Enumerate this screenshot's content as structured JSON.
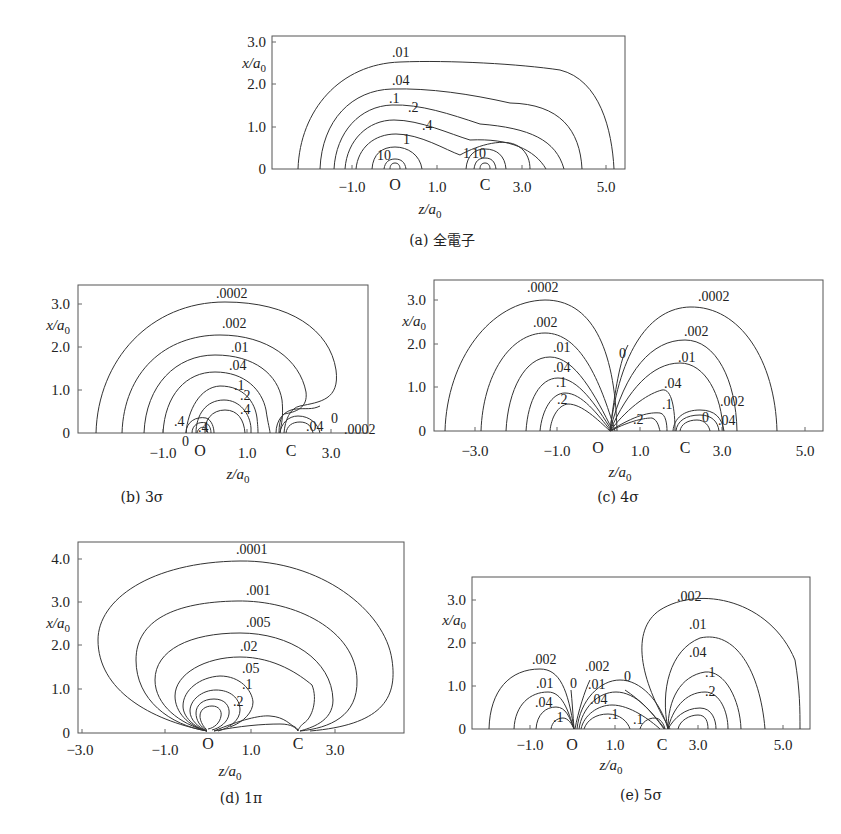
{
  "chart_data": [
    {
      "id": "a",
      "type": "contour",
      "caption": "(a) 全電子",
      "title": "全電子",
      "xlabel": "z/a0",
      "ylabel": "x/a0",
      "xticks": [
        "-1.0",
        "1.0",
        "3.0",
        "5.0"
      ],
      "xtick_values": [
        -1.0,
        1.0,
        3.0,
        5.0
      ],
      "yticks": [
        "0",
        "1.0",
        "2.0",
        "3.0"
      ],
      "ytick_values": [
        0,
        1.0,
        2.0,
        3.0
      ],
      "xlim": [
        -2.9,
        5.5
      ],
      "ylim": [
        0,
        3.1
      ],
      "atoms": [
        {
          "label": "O",
          "z": 0.0
        },
        {
          "label": "C",
          "z": 2.13
        }
      ],
      "contour_levels": [
        "10",
        "1",
        ".4",
        ".2",
        ".1",
        ".04",
        ".01",
        "10",
        "1"
      ],
      "contour_labels": [
        {
          "text": ".01",
          "z": 0.2,
          "x": 2.55
        },
        {
          "text": ".04",
          "z": 0.2,
          "x": 1.95
        },
        {
          "text": ".1",
          "z": 0.1,
          "x": 1.55
        },
        {
          "text": ".2",
          "z": 0.5,
          "x": 1.3
        },
        {
          "text": ".4",
          "z": 0.9,
          "x": 0.95
        },
        {
          "text": "1",
          "z": 0.35,
          "x": 0.62
        },
        {
          "text": "10",
          "z": -0.1,
          "x": 0.28
        },
        {
          "text": "1",
          "z": 1.8,
          "x": 0.3
        },
        {
          "text": "10",
          "z": 2.05,
          "x": 0.3
        }
      ]
    },
    {
      "id": "b",
      "type": "contour",
      "caption": "(b) 3σ",
      "title": "3σ",
      "xlabel": "z/a0",
      "ylabel": "x/a0",
      "xticks": [
        "-1.0",
        "1.0",
        "3.0"
      ],
      "xtick_values": [
        -1.0,
        1.0,
        3.0
      ],
      "yticks": [
        "0",
        "1.0",
        "2.0",
        "3.0"
      ],
      "ytick_values": [
        0,
        1.0,
        2.0,
        3.0
      ],
      "xlim": [
        -2.8,
        3.9
      ],
      "ylim": [
        0,
        3.5
      ],
      "atoms": [
        {
          "label": "O",
          "z": 0.0
        },
        {
          "label": "C",
          "z": 2.13
        }
      ],
      "contour_levels": [
        ".0002",
        ".002",
        ".01",
        ".04",
        ".1",
        ".2",
        ".4",
        ".4",
        ".4",
        "0",
        ".04",
        "0",
        ".0002"
      ],
      "contour_labels": [
        {
          "text": ".0002",
          "z": 1.0,
          "x": 3.25
        },
        {
          "text": ".002",
          "z": 1.0,
          "x": 2.55
        },
        {
          "text": ".01",
          "z": 1.0,
          "x": 1.95
        },
        {
          "text": ".04",
          "z": 0.9,
          "x": 1.55
        },
        {
          "text": ".1",
          "z": 0.9,
          "x": 1.05
        },
        {
          "text": ".2",
          "z": 1.0,
          "x": 0.85
        },
        {
          "text": ".4",
          "z": 1.0,
          "x": 0.55
        },
        {
          "text": ".4",
          "z": -0.35,
          "x": 0.25
        },
        {
          "text": ".4",
          "z": 0.1,
          "x": 0.12
        },
        {
          "text": "0",
          "z": -0.3,
          "x": -0.05
        },
        {
          "text": ".04",
          "z": 2.75,
          "x": 0.2
        },
        {
          "text": "0",
          "z": 3.15,
          "x": 0.4
        },
        {
          "text": ".0002",
          "z": 3.6,
          "x": 0.15
        }
      ]
    },
    {
      "id": "c",
      "type": "contour",
      "caption": "(c) 4σ",
      "title": "4σ",
      "xlabel": "z/a0",
      "ylabel": "x/a0",
      "xticks": [
        "-3.0",
        "-1.0",
        "1.0",
        "3.0",
        "5.0"
      ],
      "xtick_values": [
        -3.0,
        -1.0,
        1.0,
        3.0,
        5.0
      ],
      "yticks": [
        "0",
        "1.0",
        "2.0",
        "3.0"
      ],
      "ytick_values": [
        0,
        1.0,
        2.0,
        3.0
      ],
      "xlim": [
        -4.0,
        5.6
      ],
      "ylim": [
        0,
        3.5
      ],
      "atoms": [
        {
          "label": "O",
          "z": 0.0
        },
        {
          "label": "C",
          "z": 2.13
        }
      ],
      "contour_levels": [
        ".0002",
        ".002",
        ".01",
        ".04",
        ".1",
        ".2",
        "0",
        ".0002",
        ".002",
        ".01",
        ".04",
        ".1",
        ".2",
        ".002",
        "0",
        ".04"
      ],
      "contour_labels": [
        {
          "text": ".0002",
          "z": -1.5,
          "x": 3.35
        },
        {
          "text": ".002",
          "z": -1.1,
          "x": 2.5
        },
        {
          "text": ".01",
          "z": -0.9,
          "x": 1.85
        },
        {
          "text": ".04",
          "z": -0.85,
          "x": 1.4
        },
        {
          "text": ".1",
          "z": -0.85,
          "x": 1.05
        },
        {
          "text": ".2",
          "z": -0.85,
          "x": 0.7
        },
        {
          "text": "0",
          "z": 0.45,
          "x": 1.85
        },
        {
          "text": ".0002",
          "z": 3.2,
          "x": 3.1
        },
        {
          "text": ".002",
          "z": 2.7,
          "x": 2.35
        },
        {
          "text": ".01",
          "z": 2.55,
          "x": 1.7
        },
        {
          "text": ".04",
          "z": 1.9,
          "x": 1.05
        },
        {
          "text": ".1",
          "z": 1.7,
          "x": 0.6
        },
        {
          "text": ".2",
          "z": 1.15,
          "x": 0.3
        },
        {
          "text": ".002",
          "z": 3.2,
          "x": 0.7
        },
        {
          "text": "0",
          "z": 2.55,
          "x": 0.28
        },
        {
          "text": ".04",
          "z": 3.2,
          "x": 0.2
        }
      ]
    },
    {
      "id": "d",
      "type": "contour",
      "caption": "(d) 1π",
      "title": "1π",
      "xlabel": "z/a0",
      "ylabel": "x/a0",
      "xticks": [
        "-3.0",
        "-1.0",
        "1.0",
        "3.0"
      ],
      "xtick_values": [
        -3.0,
        -1.0,
        1.0,
        3.0
      ],
      "yticks": [
        "0",
        "1.0",
        "2.0",
        "3.0",
        "4.0"
      ],
      "ytick_values": [
        0,
        1.0,
        2.0,
        3.0,
        4.0
      ],
      "xlim": [
        -3.1,
        4.5
      ],
      "ylim": [
        0,
        4.3
      ],
      "atoms": [
        {
          "label": "O",
          "z": 0.0
        },
        {
          "label": "C",
          "z": 2.13
        }
      ],
      "contour_levels": [
        ".0001",
        ".001",
        ".005",
        ".02",
        ".05",
        ".1",
        ".2"
      ],
      "contour_labels": [
        {
          "text": ".0001",
          "z": 1.1,
          "x": 4.1
        },
        {
          "text": ".001",
          "z": 1.1,
          "x": 3.1
        },
        {
          "text": ".005",
          "z": 1.1,
          "x": 2.35
        },
        {
          "text": ".02",
          "z": 0.9,
          "x": 1.8
        },
        {
          "text": ".05",
          "z": 0.9,
          "x": 1.3
        },
        {
          "text": ".1",
          "z": 0.8,
          "x": 1.0
        },
        {
          "text": ".2",
          "z": 0.6,
          "x": 0.6
        }
      ]
    },
    {
      "id": "e",
      "type": "contour",
      "caption": "(e) 5σ",
      "title": "5σ",
      "xlabel": "z/a0",
      "ylabel": "x/a0",
      "xticks": [
        "-1.0",
        "1.0",
        "3.0",
        "5.0"
      ],
      "xtick_values": [
        -1.0,
        1.0,
        3.0,
        5.0
      ],
      "yticks": [
        "0",
        "1.0",
        "2.0",
        "3.0"
      ],
      "ytick_values": [
        0,
        1.0,
        2.0,
        3.0
      ],
      "xlim": [
        -2.3,
        5.7
      ],
      "ylim": [
        0,
        3.5
      ],
      "atoms": [
        {
          "label": "O",
          "z": 0.0
        },
        {
          "label": "C",
          "z": 2.13
        }
      ],
      "contour_levels": [
        ".002",
        ".01",
        ".04",
        ".1",
        "0",
        ".002",
        ".01",
        ".04",
        ".1",
        "0",
        ".1",
        ".002",
        ".01",
        ".04",
        ".1",
        ".2"
      ],
      "contour_labels": [
        {
          "text": ".002",
          "z": -0.75,
          "x": 1.65
        },
        {
          "text": ".01",
          "z": -0.75,
          "x": 1.05
        },
        {
          "text": ".04",
          "z": -0.75,
          "x": 0.55
        },
        {
          "text": ".1",
          "z": -0.3,
          "x": 0.25
        },
        {
          "text": "0",
          "z": -0.1,
          "x": 1.1
        },
        {
          "text": ".002",
          "z": 0.65,
          "x": 1.45
        },
        {
          "text": ".01",
          "z": 0.65,
          "x": 1.05
        },
        {
          "text": ".04",
          "z": 0.65,
          "x": 0.7
        },
        {
          "text": ".1",
          "z": 0.9,
          "x": 0.35
        },
        {
          "text": "0",
          "z": 1.4,
          "x": 1.25
        },
        {
          "text": ".1",
          "z": 1.65,
          "x": 0.25
        },
        {
          "text": ".002",
          "z": 3.1,
          "x": 3.1
        },
        {
          "text": ".01",
          "z": 3.2,
          "x": 2.4
        },
        {
          "text": ".04",
          "z": 3.2,
          "x": 1.7
        },
        {
          "text": ".1",
          "z": 3.35,
          "x": 1.25
        },
        {
          "text": ".2",
          "z": 3.35,
          "x": 0.8
        }
      ]
    }
  ]
}
